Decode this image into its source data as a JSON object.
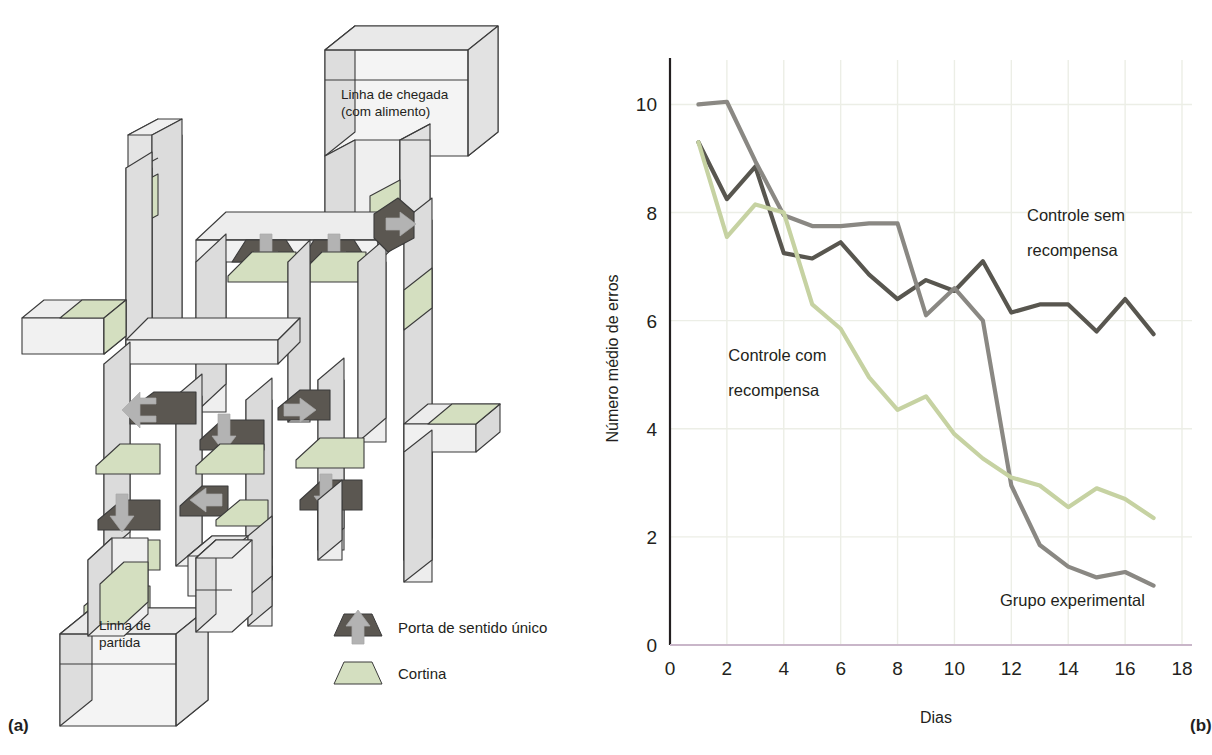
{
  "figure": {
    "panel_a_letter": "(a)",
    "panel_b_letter": "(b)"
  },
  "maze": {
    "finish_label_line1": "Linha de chegada",
    "finish_label_line2": "(com alimento)",
    "start_label_line1": "Linha de",
    "start_label_line2": "partida",
    "legend": [
      {
        "icon": "one-way-door-icon",
        "label": "Porta de sentido único",
        "color": "#5b5751"
      },
      {
        "icon": "curtain-icon",
        "label": "Cortina",
        "color": "#d4dfc0"
      }
    ],
    "colors": {
      "wall_face": "#efefef",
      "wall_side": "#dcdcdc",
      "outline": "#3b3b3b",
      "curtain": "#d4dfc0",
      "door": "#5b5751",
      "arrow": "#b3b3b3"
    }
  },
  "chart_data": {
    "type": "line",
    "title": "",
    "xlabel": "Dias",
    "ylabel": "Número médio de erros",
    "xlim": [
      0,
      18
    ],
    "ylim": [
      0,
      10.6
    ],
    "xticks": [
      0,
      2,
      4,
      6,
      8,
      10,
      12,
      14,
      16,
      18
    ],
    "yticks": [
      0,
      2,
      4,
      6,
      8,
      10
    ],
    "grid": true,
    "legend_position": "inline-annotations",
    "series": [
      {
        "name": "Controle sem recompensa",
        "color": "#58564f",
        "label_x": 12.6,
        "label_y": 7.55,
        "x": [
          1,
          2,
          3,
          4,
          5,
          6,
          7,
          8,
          9,
          10,
          11,
          12,
          13,
          14,
          15,
          16,
          17
        ],
        "values": [
          9.3,
          8.25,
          8.85,
          7.25,
          7.15,
          7.45,
          6.85,
          6.4,
          6.75,
          6.55,
          7.1,
          6.15,
          6.3,
          6.3,
          5.8,
          6.4,
          5.75
        ]
      },
      {
        "name": "Grupo experimental",
        "color": "#8a8883",
        "label_x": 13.0,
        "label_y": 0.75,
        "x": [
          1,
          2,
          3,
          4,
          5,
          6,
          7,
          8,
          9,
          10,
          11,
          12,
          13,
          14,
          15,
          16,
          17
        ],
        "values": [
          10.0,
          10.05,
          8.95,
          7.95,
          7.75,
          7.75,
          7.8,
          7.8,
          6.1,
          6.6,
          6.0,
          2.95,
          1.85,
          1.45,
          1.25,
          1.35,
          1.1
        ]
      },
      {
        "name": "Controle com recompensa",
        "color": "#c6d2a2",
        "label_x": 2.4,
        "label_y": 5.0,
        "x": [
          1,
          2,
          3,
          4,
          5,
          6,
          7,
          8,
          9,
          10,
          11,
          12,
          13,
          14,
          15,
          16,
          17
        ],
        "values": [
          9.3,
          7.55,
          8.15,
          8.0,
          6.3,
          5.85,
          4.95,
          4.35,
          4.6,
          3.9,
          3.45,
          3.1,
          2.95,
          2.55,
          2.9,
          2.7,
          2.35
        ]
      }
    ],
    "series_labels": [
      {
        "text": "Controle sem",
        "x": 12.55,
        "y": 7.85
      },
      {
        "text": "recompensa",
        "x": 12.55,
        "y": 7.2
      },
      {
        "text": "Controle com",
        "x": 2.05,
        "y": 5.25
      },
      {
        "text": "recompensa",
        "x": 2.05,
        "y": 4.6
      },
      {
        "text": "Grupo experimental",
        "x": 11.6,
        "y": 0.72
      }
    ],
    "colors": {
      "grid": "#eceee6",
      "axis": "#231f20",
      "baseline_tint": "#c9b6c9"
    }
  }
}
